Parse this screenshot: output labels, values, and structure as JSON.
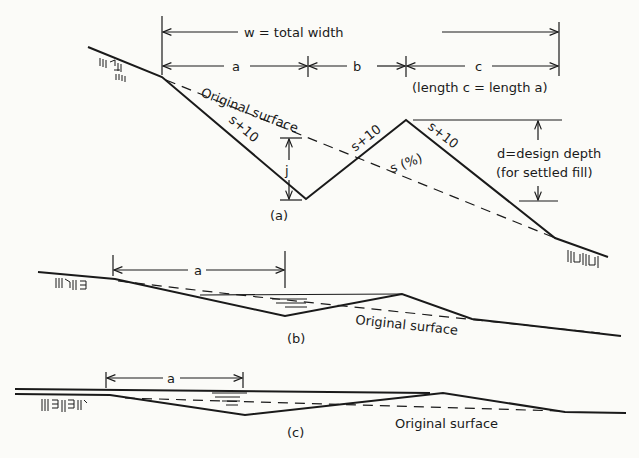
{
  "figure": {
    "panel_a": {
      "caption": "(a)",
      "total_width_label": "w = total width",
      "dim_a": "a",
      "dim_b": "b",
      "dim_c": "c",
      "length_note": "(length c = length a)",
      "original_surface": "Original surface",
      "slope_left": "s+10",
      "slope_middle": "s+10",
      "slope_right": "s+10",
      "slope_ground": "s (%)",
      "dim_j": "j",
      "design_depth": "d=design depth",
      "design_depth_note": "(for settled fill)"
    },
    "panel_b": {
      "caption": "(b)",
      "dim_a": "a",
      "original_surface": "Original surface"
    },
    "panel_c": {
      "caption": "(c)",
      "dim_a": "a",
      "original_surface": "Original surface"
    }
  },
  "colors": {
    "ink": "#1a1a1a",
    "paper": "#fbfbf8"
  }
}
